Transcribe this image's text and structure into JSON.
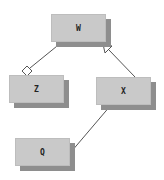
{
  "diagram": {
    "type": "uml-class-diagram",
    "colors": {
      "box_fill": "#c9c9c9",
      "shadow": "#8e8e8e",
      "line": "#555555",
      "background": "#ffffff"
    },
    "nodes": [
      {
        "id": "W",
        "label": "W",
        "x": 51,
        "y": 14,
        "w": 55,
        "h": 28
      },
      {
        "id": "Z",
        "label": "Z",
        "x": 9,
        "y": 75,
        "w": 55,
        "h": 28
      },
      {
        "id": "X",
        "label": "X",
        "x": 96,
        "y": 77,
        "w": 55,
        "h": 28
      },
      {
        "id": "Q",
        "label": "Q",
        "x": 15,
        "y": 138,
        "w": 55,
        "h": 28
      }
    ],
    "edges": [
      {
        "from": "Z",
        "to": "W",
        "type": "aggregation",
        "marker": "hollow-diamond",
        "marker_end": "Z"
      },
      {
        "from": "X",
        "to": "W",
        "type": "generalization",
        "marker": "hollow-triangle",
        "marker_end": "W"
      },
      {
        "from": "Q",
        "to": "X",
        "type": "association",
        "marker": "none"
      }
    ]
  }
}
